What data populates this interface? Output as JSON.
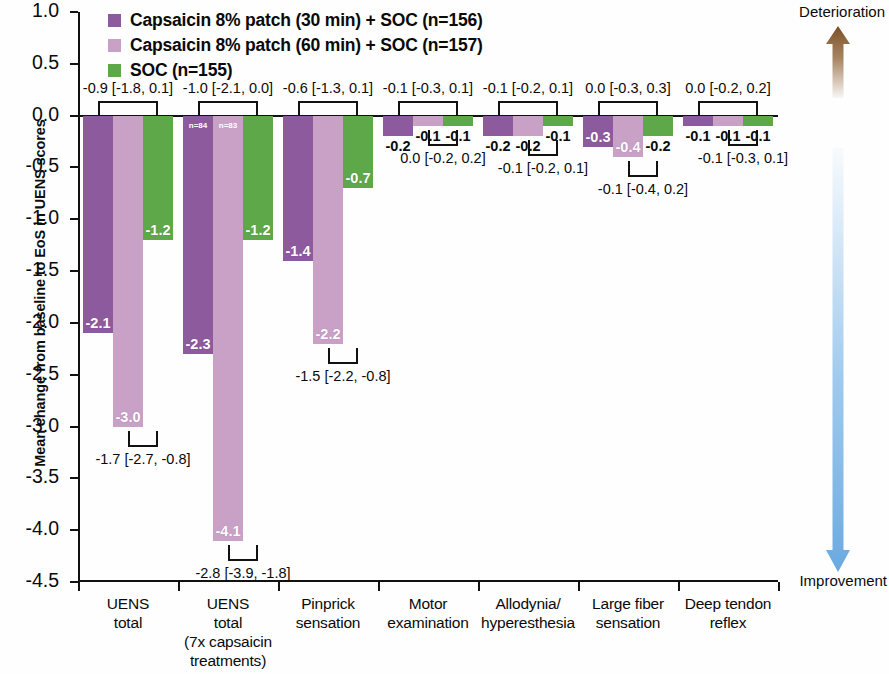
{
  "chart_data": {
    "type": "bar",
    "title": "",
    "ylabel": "Mean change from baseline to EoS in UENS scores",
    "xlabel": "",
    "ylim": [
      -4.5,
      1.0
    ],
    "ytick_values": [
      1.0,
      0.5,
      0.0,
      -0.5,
      -1.0,
      -1.5,
      -2.0,
      -2.5,
      -3.0,
      -3.5,
      -4.0,
      -4.5
    ],
    "ytick_labels": [
      "1.0",
      "0.5",
      "0.0",
      "-0.5",
      "-1.0",
      "-1.5",
      "-2.0",
      "-2.5",
      "-3.0",
      "-3.5",
      "-4.0",
      "-4.5"
    ],
    "grid": false,
    "legend_position": "top-left",
    "series": [
      {
        "name": "Capsaicin 8% patch (30 min) + SOC (n=156)",
        "color": "#8e5a9e",
        "values": [
          -2.1,
          -2.3,
          -1.4,
          -0.2,
          -0.2,
          -0.3,
          -0.1
        ]
      },
      {
        "name": "Capsaicin 8% patch (60 min) + SOC (n=157)",
        "color": "#c9a0c6",
        "values": [
          -3.0,
          -4.1,
          -2.2,
          -0.1,
          -0.2,
          -0.4,
          -0.1
        ]
      },
      {
        "name": "SOC (n=155)",
        "color": "#5ea849",
        "values": [
          -1.2,
          -1.2,
          -0.7,
          -0.1,
          -0.1,
          -0.2,
          -0.1
        ]
      }
    ],
    "categories": [
      "UENS total",
      "UENS total (7x capsaicin treatments)",
      "Pinprick sensation",
      "Motor examination",
      "Allodynia/hyperesthesia",
      "Large fiber sensation",
      "Deep tendon reflex"
    ],
    "annotations_top": [
      "-0.9 [-1.8, 0.1]",
      "-1.0 [-2.1, 0.0]",
      "-0.6 [-1.3, 0.1]",
      "-0.1 [-0.3, 0.1]",
      "-0.1 [-0.2, 0.1]",
      "0.0 [-0.3, 0.3]",
      "0.0 [-0.2, 0.2]"
    ],
    "annotations_bottom": [
      "-1.7 [-2.7, -0.8]",
      "-2.8 [-3.9, -1.8]",
      "-1.5 [-2.2, -0.8]",
      "0.0 [-0.2, 0.2]",
      "-0.1 [-0.2, 0.1]",
      "-0.1 [-0.4, 0.2]",
      "-0.1 [-0.3, 0.1]"
    ],
    "inline_n_labels": {
      "group": 1,
      "labels": [
        "n=84",
        "n=83"
      ]
    }
  },
  "legend": {
    "items": [
      {
        "label": "Capsaicin 8% patch (30 min) + SOC (n=156)",
        "color": "#8e5a9e"
      },
      {
        "label": "Capsaicin 8% patch (60 min) + SOC (n=157)",
        "color": "#c9a0c6"
      },
      {
        "label": "SOC (n=155)",
        "color": "#5ea849"
      }
    ]
  },
  "axis": {
    "y_title": "Mean change from baseline to EoS in UENS scores",
    "y_ticks": [
      "1.0",
      "0.5",
      "0.0",
      "-0.5",
      "-1.0",
      "-1.5",
      "-2.0",
      "-2.5",
      "-3.0",
      "-3.5",
      "-4.0",
      "-4.5"
    ]
  },
  "categories": [
    {
      "line1": "UENS",
      "line2": "total",
      "line3": "",
      "line4": ""
    },
    {
      "line1": "UENS",
      "line2": "total",
      "line3": "(7x capsaicin",
      "line4": "treatments)"
    },
    {
      "line1": "Pinprick",
      "line2": "sensation",
      "line3": "",
      "line4": ""
    },
    {
      "line1": "Motor",
      "line2": "examination",
      "line3": "",
      "line4": ""
    },
    {
      "line1": "Allodynia/",
      "line2": "hyperesthesia",
      "line3": "",
      "line4": ""
    },
    {
      "line1": "Large fiber",
      "line2": "sensation",
      "line3": "",
      "line4": ""
    },
    {
      "line1": "Deep tendon",
      "line2": "reflex",
      "line3": "",
      "line4": ""
    }
  ],
  "bar_value_labels": [
    [
      "-2.1",
      "-3.0",
      "-1.2"
    ],
    [
      "-2.3",
      "-4.1",
      "-1.2"
    ],
    [
      "-1.4",
      "-2.2",
      "-0.7"
    ],
    [
      "-0.2",
      "-0.1",
      "-0.1"
    ],
    [
      "-0.2",
      "-0.2",
      "-0.1"
    ],
    [
      "-0.3",
      "-0.4",
      "-0.2"
    ],
    [
      "-0.1",
      "-0.1",
      "-0.1"
    ]
  ],
  "ci_top": [
    "-0.9 [-1.8, 0.1]",
    "-1.0 [-2.1, 0.0]",
    "-0.6 [-1.3, 0.1]",
    "-0.1 [-0.3, 0.1]",
    "-0.1 [-0.2, 0.1]",
    "0.0 [-0.3, 0.3]",
    "0.0 [-0.2, 0.2]"
  ],
  "ci_bottom": [
    "-1.7 [-2.7, -0.8]",
    "-2.8 [-3.9, -1.8]",
    "-1.5 [-2.2, -0.8]",
    "0.0 [-0.2, 0.2]",
    "-0.1 [-0.2, 0.1]",
    "-0.1 [-0.4, 0.2]",
    "-0.1 [-0.3, 0.1]"
  ],
  "inline_n": [
    "n=84",
    "n=83"
  ],
  "direction": {
    "top_label": "Deterioration",
    "bottom_label": "Improvement",
    "top_color": "#8a5c2e",
    "bottom_color": "#7fb8e8"
  }
}
